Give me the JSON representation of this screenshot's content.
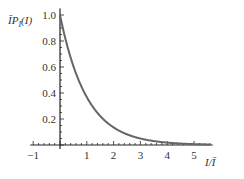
{
  "chart_data": {
    "type": "line",
    "title": "",
    "xlabel": "I/Ī",
    "ylabel": "ĪP_I(I)",
    "xlim": [
      -1,
      5.7
    ],
    "ylim": [
      0,
      1.05
    ],
    "grid": false,
    "legend": null,
    "x_ticks": [
      -1,
      1,
      2,
      3,
      4,
      5
    ],
    "x_tick_labels": [
      "−1",
      "1",
      "2",
      "3",
      "4",
      "5"
    ],
    "y_ticks": [
      0.2,
      0.4,
      0.6,
      0.8,
      1.0
    ],
    "y_tick_labels": [
      "0.2",
      "0.4",
      "0.6",
      "0.8",
      "1.0"
    ],
    "series": [
      {
        "name": "exp(-I/Ī)",
        "x": [
          0,
          0.25,
          0.5,
          0.75,
          1,
          1.5,
          2,
          2.5,
          3,
          3.5,
          4,
          4.5,
          5,
          5.5
        ],
        "values": [
          1.0,
          0.779,
          0.607,
          0.472,
          0.368,
          0.223,
          0.135,
          0.082,
          0.05,
          0.03,
          0.018,
          0.011,
          0.007,
          0.004
        ],
        "color": "#666666"
      }
    ]
  },
  "labels": {
    "ylabel_main": "ĪP",
    "ylabel_sub": "I",
    "ylabel_arg": "(I)",
    "xlabel": "I/Ī"
  }
}
